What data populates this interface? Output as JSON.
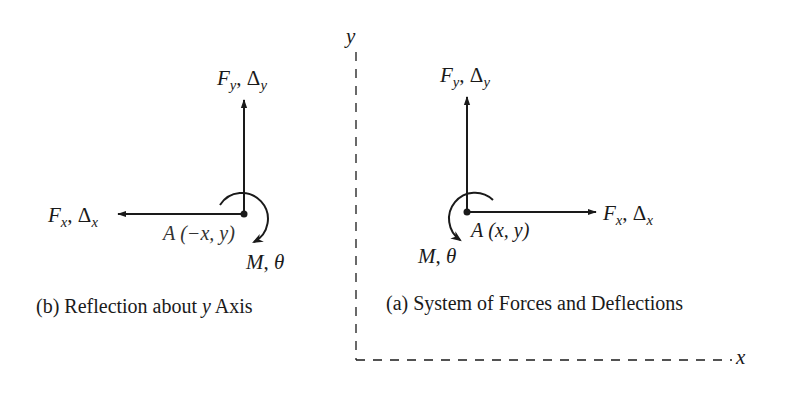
{
  "axes": {
    "y_label": "y",
    "x_label": "x",
    "style": "dashed",
    "color": "#1a1a1a"
  },
  "panel_b": {
    "caption_prefix": "(b) Reflection about ",
    "caption_var": "y",
    "caption_suffix": " Axis",
    "point_label_prefix": "A",
    "point_label_coords": "(−x, y)",
    "fy_force": "F",
    "fy_force_sub": "y",
    "fy_sep": ", ",
    "fy_delta": "Δ",
    "fy_delta_sub": "y",
    "fx_force": "F",
    "fx_force_sub": "x",
    "fx_sep": ", ",
    "fx_delta": "Δ",
    "fx_delta_sub": "x",
    "moment_label": "M",
    "moment_sep": ", ",
    "rotation_label": "θ",
    "horizontal_arrow_direction": "left",
    "moment_direction": "clockwise"
  },
  "panel_a": {
    "caption": "(a) System of Forces and Deflections",
    "point_label_prefix": "A",
    "point_label_coords": "(x, y)",
    "fy_force": "F",
    "fy_force_sub": "y",
    "fy_sep": ", ",
    "fy_delta": "Δ",
    "fy_delta_sub": "y",
    "fx_force": "F",
    "fx_force_sub": "x",
    "fx_sep": ", ",
    "fx_delta": "Δ",
    "fx_delta_sub": "x",
    "moment_label": "M",
    "moment_sep": ", ",
    "rotation_label": "θ",
    "horizontal_arrow_direction": "right",
    "moment_direction": "counterclockwise"
  }
}
